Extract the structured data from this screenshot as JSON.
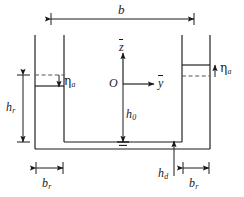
{
  "figure": {
    "type": "engineering-cross-section-diagram",
    "background_color": "#ffffff",
    "line_color": "#1a1a1a",
    "dashed_color": "#555555"
  },
  "labels": {
    "width_total": "b",
    "riser_height": "h",
    "riser_height_sub": "r",
    "depth_center": "h",
    "depth_center_sub": "0",
    "duct_height": "h",
    "duct_height_sub": "d",
    "riser_width_left": "b",
    "riser_width_left_sub": "r",
    "riser_width_right": "b",
    "riser_width_right_sub": "r",
    "eta_left": "η",
    "eta_left_sub": "a",
    "eta_right": "η",
    "eta_right_sub": "a",
    "axis_vertical": "z",
    "axis_horizontal": "y",
    "origin": "O"
  },
  "annotations": {
    "eta_left_arrow_direction": "down",
    "eta_right_arrow_direction": "up",
    "datum_symbol": "ground-hatch-triangle",
    "overbar_on_axes": true
  },
  "dimensions": {
    "image_width": 244,
    "image_height": 197
  }
}
